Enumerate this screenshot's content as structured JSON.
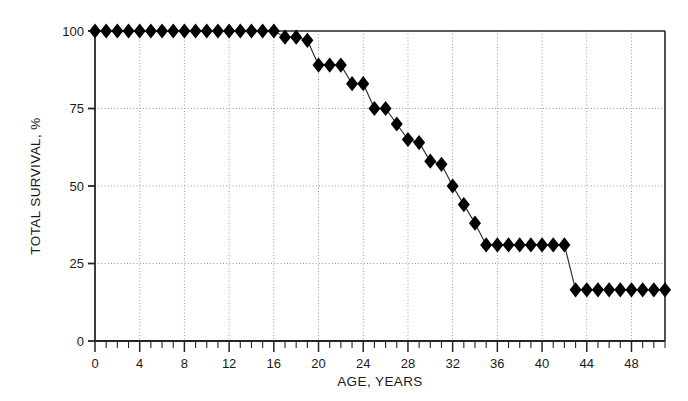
{
  "chart_data": {
    "type": "line",
    "title": "",
    "xlabel": "AGE, YEARS",
    "ylabel": "TOTAL SURVIVAL, %",
    "xlim": [
      0,
      51
    ],
    "ylim": [
      0,
      100
    ],
    "xticks": [
      0,
      4,
      8,
      12,
      16,
      20,
      24,
      28,
      32,
      36,
      40,
      44,
      48
    ],
    "xtick_labels": [
      "0",
      "4",
      "8",
      "12",
      "16",
      "20",
      "24",
      "28",
      "32",
      "36",
      "40",
      "44",
      "48"
    ],
    "xminor_tick_step": 1,
    "yticks": [
      0,
      25,
      50,
      75,
      100
    ],
    "ytick_labels": [
      "0",
      "25",
      "50",
      "75",
      "100"
    ],
    "grid": true,
    "grid_style": "dotted",
    "grid_color": "#9a9a9a",
    "legend": null,
    "marker": "diamond",
    "marker_color": "#000000",
    "line_color": "#333333",
    "series": [
      {
        "name": "Total survival",
        "x": [
          0,
          1,
          2,
          3,
          4,
          5,
          6,
          7,
          8,
          9,
          10,
          11,
          12,
          13,
          14,
          15,
          16,
          17,
          18,
          19,
          20,
          21,
          22,
          23,
          24,
          25,
          26,
          27,
          28,
          29,
          30,
          31,
          32,
          33,
          34,
          35,
          36,
          37,
          38,
          39,
          40,
          41,
          42,
          43,
          44,
          45,
          46,
          47,
          48,
          49,
          50,
          51
        ],
        "values": [
          100,
          100,
          100,
          100,
          100,
          100,
          100,
          100,
          100,
          100,
          100,
          100,
          100,
          100,
          100,
          100,
          100,
          98,
          98,
          97,
          89,
          89,
          89,
          83,
          83,
          75,
          75,
          70,
          65,
          64,
          58,
          57,
          50,
          44,
          38,
          31,
          31,
          31,
          31,
          31,
          31,
          31,
          31,
          16.5,
          16.5,
          16.5,
          16.5,
          16.5,
          16.5,
          16.5,
          16.5,
          16.5
        ]
      }
    ]
  },
  "axes": {
    "x_title": "AGE, YEARS",
    "y_title": "TOTAL SURVIVAL, %"
  }
}
